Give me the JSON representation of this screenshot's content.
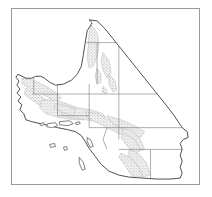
{
  "figure": {
    "kind": "map",
    "title": "Southern California county map with shaded distribution areas",
    "frame": {
      "x": 11,
      "y": 8,
      "width": 189,
      "height": 177,
      "border_color": "#9a9a9a"
    },
    "background_color": "#ffffff"
  },
  "map": {
    "region_name": "Southern California",
    "outline_color": "#3a3a3a",
    "county_line_color": "#808080",
    "shading_color": "#b8b8b8",
    "shading_label": "shaded distribution area",
    "island_outline_color": "#4a4a4a",
    "viewbox": "0 0 189 177",
    "state_outline": "M 78,11 L 81,14 L 76,22 L 74,34 L 72,47 L 70,58 L 66,66 L 60,72 L 52,76 L 44,77 L 38,74 L 33,70 L 29,68 L 24,68 L 20,70 L 14,70 L 10,68 L 6,66 L 4,69 L 7,73 L 5,77 L 8,81 L 5,85 L 9,89 L 6,93 L 10,97 L 8,102 L 12,106 L 14,112 L 20,114 L 29,116 L 38,118 L 46,120 L 56,122 L 64,124 L 70,128 L 74,134 L 78,141 L 84,149 L 90,157 L 98,164 L 108,168 L 118,170 L 132,171 L 146,172 L 160,172 L 170,171 L 172,166 L 170,160 L 172,154 L 170,148 L 172,142 L 170,136 L 173,132 L 178,130 L 177,124 L 172,120 L 168,114 L 164,108 L 158,100 L 150,90 L 142,80 L 134,70 L 126,60 L 118,50 L 110,40 L 102,30 L 94,20 L 86,12 Z",
    "county_lines": [
      "M 74,34 L 84,34",
      "M 78,76 L 78,120",
      "M 78,86 L 150,86",
      "M 108,86 L 108,120",
      "M 78,120 L 172,120",
      "M 108,120 L 108,132",
      "M 96,120 L 92,132 L 96,142",
      "M 108,142 L 178,142",
      "M 140,142 L 140,172",
      "M 20,86 L 78,86",
      "M 22,70 L 22,86",
      "M 46,76 L 46,108",
      "M 46,108 L 78,108",
      "M 86,34 L 86,76",
      "M 108,34 L 108,86",
      "M 84,34 L 140,34"
    ],
    "shaded_areas": [
      {
        "name": "eastern-sierra-band",
        "d": "M 80,16 L 86,24 L 88,36 L 86,48 L 82,58 L 78,60 L 76,50 L 77,36 L 78,24 Z"
      },
      {
        "name": "inyo-patch-north",
        "d": "M 92,44 L 98,52 L 100,64 L 96,70 L 92,62 L 90,52 Z"
      },
      {
        "name": "inyo-patch-mid",
        "d": "M 86,60 L 90,66 L 90,74 L 86,76 L 84,68 Z"
      },
      {
        "name": "inyo-patch-south",
        "d": "M 98,66 L 104,72 L 106,82 L 102,84 L 98,76 Z"
      },
      {
        "name": "inyo-patch-small",
        "d": "M 92,78 L 96,82 L 95,86 L 91,84 Z"
      },
      {
        "name": "coast-range-north",
        "d": "M 10,70 L 22,72 L 34,78 L 44,84 L 50,90 L 44,94 L 34,88 L 22,82 L 10,76 Z"
      },
      {
        "name": "coast-range-mid",
        "d": "M 14,80 L 26,86 L 38,94 L 48,102 L 44,108 L 32,100 L 20,92 L 12,86 Z"
      },
      {
        "name": "transverse-ranges-core",
        "d": "M 30,92 L 44,92 L 56,96 L 66,100 L 74,104 L 74,112 L 62,112 L 48,110 L 34,106 L 28,100 Z"
      },
      {
        "name": "san-gabriel-band",
        "d": "M 52,100 L 66,100 L 80,102 L 92,106 L 96,112 L 88,114 L 74,112 L 60,110 L 50,106 Z"
      },
      {
        "name": "san-bernardino-band",
        "d": "M 74,104 L 86,106 L 98,112 L 110,118 L 118,124 L 112,128 L 100,122 L 88,116 L 76,110 Z"
      },
      {
        "name": "mojave-band",
        "d": "M 96,108 L 110,112 L 124,118 L 134,124 L 130,130 L 116,124 L 102,116 Z"
      },
      {
        "name": "san-jacinto-band",
        "d": "M 112,120 L 122,124 L 130,132 L 134,142 L 128,144 L 120,134 L 112,126 Z"
      },
      {
        "name": "peninsular-ranges-north",
        "d": "M 114,126 L 124,132 L 130,142 L 124,146 L 116,138 L 110,130 Z"
      },
      {
        "name": "peninsular-ranges-south",
        "d": "M 118,142 L 128,146 L 136,156 L 140,168 L 132,170 L 126,158 L 118,148 Z"
      },
      {
        "name": "san-diego-band",
        "d": "M 110,146 L 120,150 L 128,160 L 132,170 L 122,170 L 114,158 L 108,150 Z"
      },
      {
        "name": "coastal-ventura",
        "d": "M 44,96 L 56,98 L 64,102 L 62,108 L 50,104 L 42,100 Z"
      }
    ],
    "islands": [
      {
        "name": "san-miguel-island",
        "d": "M 28,116 L 32,115 L 33,117 L 29,118 Z"
      },
      {
        "name": "santa-rosa-island",
        "d": "M 36,116 L 44,115 L 46,118 L 40,120 L 35,119 Z"
      },
      {
        "name": "santa-cruz-island",
        "d": "M 48,114 L 58,113 L 62,116 L 56,118 L 48,117 Z"
      },
      {
        "name": "anacapa-island",
        "d": "M 64,115 L 68,114 L 69,116 L 65,117 Z"
      },
      {
        "name": "santa-barbara-island",
        "d": "M 52,140 L 55,139 L 56,142 L 53,143 Z"
      },
      {
        "name": "santa-catalina-island",
        "d": "M 76,130 L 80,133 L 82,139 L 79,140 L 76,134 Z"
      },
      {
        "name": "san-nicolas-island",
        "d": "M 38,137 L 43,136 L 44,139 L 39,140 Z"
      },
      {
        "name": "san-clemente-island",
        "d": "M 68,150 L 72,155 L 74,162 L 71,163 L 68,156 Z"
      }
    ]
  }
}
